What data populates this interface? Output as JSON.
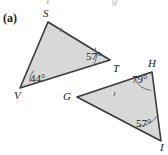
{
  "figure": {
    "part_label": "(a)",
    "fill_color": "#d8d8d8",
    "stroke_color": "#3a3a3a",
    "arc_color": "#6e6e6e",
    "background": "#ffffff",
    "clipped_top_left": "I",
    "clipped_top_right": "g"
  },
  "triangles": [
    {
      "name": "triangle-svt",
      "vertices": [
        {
          "label": "S",
          "x": 48,
          "y": 22,
          "label_x": 43,
          "label_y": 8
        },
        {
          "label": "V",
          "x": 20,
          "y": 88,
          "label_x": 14,
          "label_y": 90
        },
        {
          "label": "T",
          "x": 110,
          "y": 60,
          "label_x": 113,
          "label_y": 63
        }
      ],
      "angles": [
        {
          "at": "V",
          "value": "44°",
          "label_x": 30,
          "label_y": 73
        },
        {
          "at": "T",
          "value": "57°",
          "label_x": 86,
          "label_y": 51
        }
      ],
      "tick_marks": 1
    },
    {
      "name": "triangle-ghi",
      "vertices": [
        {
          "label": "H",
          "x": 152,
          "y": 72,
          "label_x": 148,
          "label_y": 58
        },
        {
          "label": "G",
          "x": 77,
          "y": 97,
          "label_x": 63,
          "label_y": 91
        },
        {
          "label": "I",
          "x": 161,
          "y": 141,
          "label_x": 160,
          "label_y": 142
        }
      ],
      "angles": [
        {
          "at": "H",
          "value": "79°",
          "label_x": 132,
          "label_y": 74
        },
        {
          "at": "I",
          "value": "57°",
          "label_x": 136,
          "label_y": 118
        }
      ],
      "tick_marks": 1
    }
  ]
}
